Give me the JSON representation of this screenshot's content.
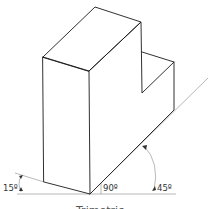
{
  "figure": {
    "type": "isometric-style pictorial of an L-shaped block",
    "angle_labels": {
      "left": "15º",
      "right_angle": "90º",
      "right": "45º"
    },
    "caption_partial": "Trimetric",
    "colors": {
      "edge": "#1a1a1a",
      "reference_line": "#9a9a9a",
      "label": "#333333"
    }
  }
}
